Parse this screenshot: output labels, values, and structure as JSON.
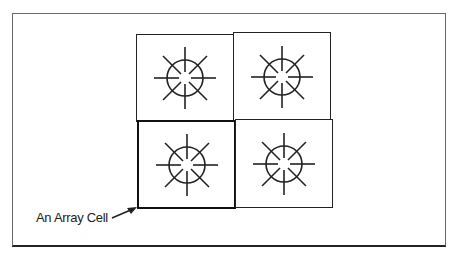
{
  "diagram": {
    "grid": {
      "rows": 2,
      "cols": 2
    },
    "cells": [
      {
        "row": 0,
        "col": 0,
        "icon": "sunburst-icon",
        "highlighted": false
      },
      {
        "row": 0,
        "col": 1,
        "icon": "sunburst-icon",
        "highlighted": false
      },
      {
        "row": 1,
        "col": 0,
        "icon": "sunburst-icon",
        "highlighted": true
      },
      {
        "row": 1,
        "col": 1,
        "icon": "sunburst-icon",
        "highlighted": false
      }
    ],
    "callout": {
      "label": "An Array Cell",
      "points_to": "cell row 1 col 0"
    },
    "colors": {
      "line": "#222222",
      "background": "#ffffff",
      "frame": "#6a6a6a"
    }
  }
}
